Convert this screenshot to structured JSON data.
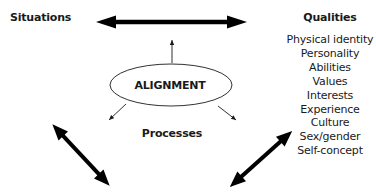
{
  "diagram": {
    "left_label": "Situations",
    "right_heading": "Qualities",
    "center_label": "ALIGNMENT",
    "bottom_label": "Processes",
    "qualities": [
      "Physical identity",
      "Personality",
      "Abilities",
      "Values",
      "Interests",
      "Experience",
      "Culture",
      "Sex/gender",
      "Self-concept"
    ],
    "arrows": [
      {
        "name": "situations-qualities",
        "type": "double",
        "weight": "thick"
      },
      {
        "name": "alignment-up",
        "type": "single",
        "weight": "thin"
      },
      {
        "name": "alignment-down-left",
        "type": "single",
        "weight": "thin"
      },
      {
        "name": "alignment-down-right",
        "type": "single",
        "weight": "thin"
      },
      {
        "name": "lower-left",
        "type": "double",
        "weight": "thick"
      },
      {
        "name": "lower-right",
        "type": "double",
        "weight": "thick"
      }
    ],
    "colors": {
      "ink": "#1a1a1a",
      "background": "#ffffff"
    }
  }
}
